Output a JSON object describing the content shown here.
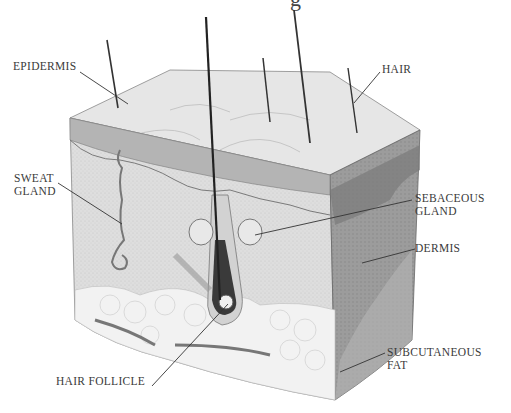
{
  "title_fragment": "g",
  "labels": {
    "epidermis": "EPIDERMIS",
    "hair": "HAIR",
    "sweat_gland_1": "SWEAT",
    "sweat_gland_2": "GLAND",
    "sebaceous_gland_1": "SEBACEOUS",
    "sebaceous_gland_2": "GLAND",
    "dermis": "DERMIS",
    "subcutaneous_fat_1": "SUBCUTANEOUS",
    "subcutaneous_fat_2": "FAT",
    "hair_follicle": "HAIR FOLLICLE"
  },
  "colors": {
    "top_face": "#e4e4e4",
    "front_face": "#dcdcdc",
    "side_face": "#9a9a9a",
    "epidermis_band": "#a8a8a8",
    "fat": "#f3f3f3",
    "follicle_dark": "#3a3a3a",
    "leader_line": "#333333"
  }
}
